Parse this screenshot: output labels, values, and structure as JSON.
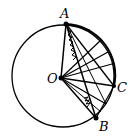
{
  "diagram": {
    "type": "geometry",
    "circle": {
      "cx": 63,
      "cy": 76,
      "r": 51
    },
    "points": {
      "A": {
        "label": "A",
        "x": 66,
        "y": 24
      },
      "O": {
        "label": "O",
        "x": 61,
        "y": 78
      },
      "C": {
        "label": "C",
        "x": 114,
        "y": 86
      },
      "B": {
        "label": "B",
        "x": 96,
        "y": 118
      }
    },
    "labels": {
      "A": "A",
      "O": "O",
      "C": "C",
      "B": "B"
    }
  }
}
